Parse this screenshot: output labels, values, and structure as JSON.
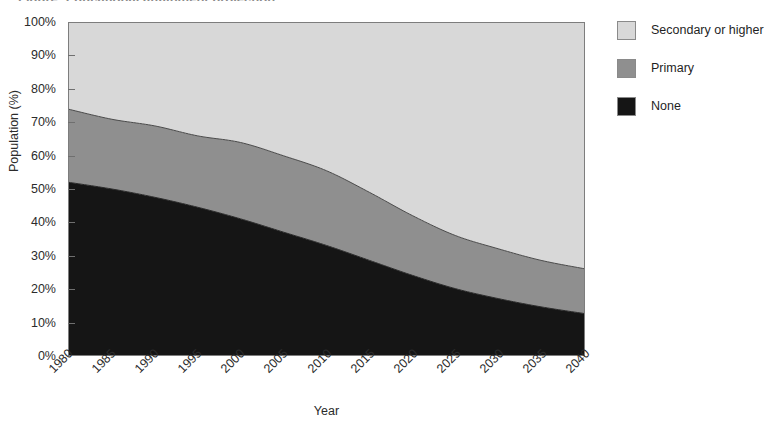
{
  "figure": {
    "title_sliver": "Figure: Educational attainment projection",
    "background": "#ffffff"
  },
  "axes": {
    "y_title": "Population (%)",
    "x_title": "Year",
    "y_ticks": [
      "0%",
      "10%",
      "20%",
      "30%",
      "40%",
      "50%",
      "60%",
      "70%",
      "80%",
      "90%",
      "100%"
    ],
    "x_ticks": [
      "1980",
      "1985",
      "1990",
      "1995",
      "2000",
      "2005",
      "2010",
      "2015",
      "2020",
      "2025",
      "2030",
      "2035",
      "2040"
    ]
  },
  "legend": {
    "position": "right",
    "items": [
      {
        "label": "Secondary or higher",
        "color": "#d8d8d8"
      },
      {
        "label": "Primary",
        "color": "#8f8f8f"
      },
      {
        "label": "None",
        "color": "#151515"
      }
    ]
  },
  "colors": {
    "secondary_or_higher": "#d8d8d8",
    "primary": "#8f8f8f",
    "none": "#151515",
    "axis": "#7d7d7d",
    "text": "#2b2b2b"
  },
  "chart_data": {
    "type": "area",
    "stacked": true,
    "title": "",
    "subtitle": "",
    "xlabel": "Year",
    "ylabel": "Population (%)",
    "xlim": [
      1980,
      2040
    ],
    "ylim": [
      0,
      100
    ],
    "grid": false,
    "legend_position": "right",
    "x": [
      1980,
      1985,
      1990,
      1995,
      2000,
      2005,
      2010,
      2015,
      2020,
      2025,
      2030,
      2035,
      2040
    ],
    "series": [
      {
        "name": "None",
        "color": "#151515",
        "values": [
          52,
          50,
          47.5,
          44.5,
          41,
          37,
          33,
          28.5,
          24,
          20,
          17,
          14.5,
          12.5
        ]
      },
      {
        "name": "Primary",
        "color": "#8f8f8f",
        "values": [
          22,
          21,
          21.5,
          21.5,
          23,
          23,
          22.5,
          20.5,
          18,
          16,
          15,
          14,
          13.5
        ]
      },
      {
        "name": "Secondary or higher",
        "color": "#d8d8d8",
        "values": [
          26,
          29,
          31,
          34,
          36,
          40,
          44.5,
          51,
          58,
          64,
          68,
          71.5,
          74
        ]
      }
    ],
    "cumulative_upper_bounds": {
      "none": [
        52,
        50,
        47.5,
        44.5,
        41,
        37,
        33,
        28.5,
        24,
        20,
        17,
        14.5,
        12.5
      ],
      "none_plus_primary": [
        74,
        71,
        69,
        66,
        64,
        60,
        55.5,
        49,
        42,
        36,
        32,
        28.5,
        26
      ],
      "total": [
        100,
        100,
        100,
        100,
        100,
        100,
        100,
        100,
        100,
        100,
        100,
        100,
        100
      ]
    }
  }
}
